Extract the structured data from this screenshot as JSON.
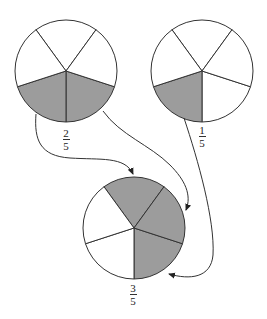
{
  "colors": {
    "background": "#ffffff",
    "shaded": "#9c9c9c",
    "unshaded": "#ffffff",
    "stroke": "#333333"
  },
  "circles": [
    {
      "id": "left",
      "label": {
        "numerator": "2",
        "denominator": "5"
      },
      "parts": 5,
      "shaded_parts": 2
    },
    {
      "id": "right",
      "label": {
        "numerator": "1",
        "denominator": "5"
      },
      "parts": 5,
      "shaded_parts": 1
    },
    {
      "id": "sum",
      "label": {
        "numerator": "3",
        "denominator": "5"
      },
      "parts": 5,
      "shaded_parts": 3
    }
  ],
  "arrows": [
    {
      "from": "left circle shaded part 1",
      "to": "sum circle top part"
    },
    {
      "from": "left circle shaded part 2",
      "to": "sum circle right part"
    },
    {
      "from": "right circle shaded part",
      "to": "sum circle lower-right part"
    }
  ]
}
